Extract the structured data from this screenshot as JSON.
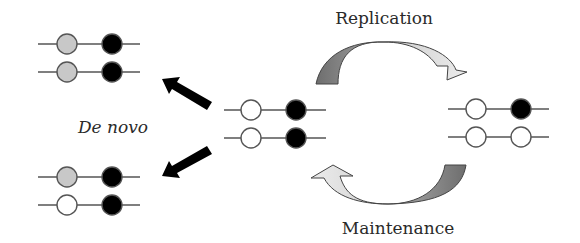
{
  "colors": {
    "background": "#ffffff",
    "line": "#555555",
    "unmethylated": "#ffffff",
    "methylated": "#000000",
    "newly_methylated": "#c8c8c8",
    "arrow_dark": "#7a7a7a",
    "arrow_light": "#dcdcdc",
    "straight_arrow": "#000000"
  },
  "labels": {
    "de_novo": "De novo",
    "replication": "Replication",
    "maintenance": "Maintenance"
  },
  "molecules": [
    {
      "id": "center",
      "description": "Hemimethylated-like starting DNA (both strands: unmethylated site, methylated site)",
      "strands": [
        {
          "y": 110,
          "x1": 224,
          "x2": 326,
          "sites": [
            {
              "x": 251,
              "state": "unmethylated"
            },
            {
              "x": 296,
              "state": "methylated"
            }
          ]
        },
        {
          "y": 138,
          "x1": 224,
          "x2": 326,
          "sites": [
            {
              "x": 251,
              "state": "unmethylated"
            },
            {
              "x": 296,
              "state": "methylated"
            }
          ]
        }
      ]
    },
    {
      "id": "de-novo-top",
      "strands": [
        {
          "y": 44,
          "x1": 38,
          "x2": 140,
          "sites": [
            {
              "x": 67,
              "state": "newly_methylated"
            },
            {
              "x": 112,
              "state": "methylated"
            }
          ]
        },
        {
          "y": 72,
          "x1": 38,
          "x2": 140,
          "sites": [
            {
              "x": 67,
              "state": "newly_methylated"
            },
            {
              "x": 112,
              "state": "methylated"
            }
          ]
        }
      ]
    },
    {
      "id": "de-novo-bottom",
      "strands": [
        {
          "y": 177,
          "x1": 38,
          "x2": 140,
          "sites": [
            {
              "x": 67,
              "state": "newly_methylated"
            },
            {
              "x": 112,
              "state": "methylated"
            }
          ]
        },
        {
          "y": 205,
          "x1": 38,
          "x2": 140,
          "sites": [
            {
              "x": 67,
              "state": "unmethylated"
            },
            {
              "x": 112,
              "state": "methylated"
            }
          ]
        }
      ]
    },
    {
      "id": "replicated",
      "strands": [
        {
          "y": 109,
          "x1": 448,
          "x2": 549,
          "sites": [
            {
              "x": 476,
              "state": "unmethylated"
            },
            {
              "x": 521,
              "state": "methylated"
            }
          ]
        },
        {
          "y": 137,
          "x1": 448,
          "x2": 549,
          "sites": [
            {
              "x": 476,
              "state": "unmethylated"
            },
            {
              "x": 521,
              "state": "unmethylated"
            }
          ]
        }
      ]
    }
  ],
  "arrows": [
    {
      "id": "de-novo-arrow-up",
      "direction": "center-to-top-left"
    },
    {
      "id": "de-novo-arrow-down",
      "direction": "center-to-bottom-left"
    },
    {
      "id": "replication-arrow",
      "direction": "center-to-right"
    },
    {
      "id": "maintenance-arrow",
      "direction": "right-to-center"
    }
  ]
}
